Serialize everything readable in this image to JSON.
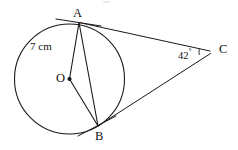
{
  "figure": {
    "type": "circle-tangent-geometry-diagram",
    "background_color": "#ffffff",
    "stroke_color": "#1a1a1a",
    "labels": {
      "center": "O",
      "tangent_point_top": "A",
      "tangent_point_bottom": "B",
      "external_vertex": "C",
      "radius_measure": "7 cm",
      "angle_value": "42",
      "angle_degree_symbol": "°"
    },
    "geometry": {
      "circle": {
        "cx": 69.5,
        "cy": 79.0,
        "r": 55.0,
        "stroke_width": 1.1
      },
      "points": {
        "O": {
          "x": 69.5,
          "y": 79.0
        },
        "A": {
          "x": 79.0,
          "y": 22.5
        },
        "B": {
          "x": 98.0,
          "y": 126.0
        },
        "C": {
          "x": 212.0,
          "y": 52.0
        }
      },
      "segments": [
        {
          "name": "radius-OA",
          "x1": 69.5,
          "y1": 79.0,
          "x2": 79.0,
          "y2": 22.5,
          "width": 1.1
        },
        {
          "name": "radius-OB",
          "x1": 69.5,
          "y1": 79.0,
          "x2": 98.0,
          "y2": 126.0,
          "width": 1.1
        },
        {
          "name": "chord-AB",
          "x1": 79.0,
          "y1": 22.5,
          "x2": 98.0,
          "y2": 126.0,
          "width": 1.1
        },
        {
          "name": "tangent-AC",
          "x1": 79.0,
          "y1": 22.5,
          "x2": 210.0,
          "y2": 51.0,
          "width": 1.0
        },
        {
          "name": "tangent-BC",
          "x1": 98.0,
          "y1": 126.0,
          "x2": 210.5,
          "y2": 53.5,
          "width": 1.0
        },
        {
          "name": "tangent-extension-at-A",
          "x1": 56.0,
          "y1": 19.0,
          "x2": 101.0,
          "y2": 26.0,
          "width": 1.0
        },
        {
          "name": "tangent-extension-at-B",
          "x1": 78.0,
          "y1": 136.0,
          "x2": 116.0,
          "y2": 116.0,
          "width": 1.0
        }
      ],
      "center_dot": {
        "cx": 69.5,
        "cy": 79.0,
        "r": 2.1
      },
      "angle_arc": {
        "cx": 212.0,
        "cy": 52.0,
        "r": 13.0,
        "start_deg": 167,
        "end_deg": 193
      }
    },
    "label_positions": {
      "A": {
        "left": 73,
        "top": 7
      },
      "B": {
        "left": 95,
        "top": 130
      },
      "C": {
        "left": 219,
        "top": 43
      },
      "O": {
        "left": 56,
        "top": 72
      },
      "radius_measure": {
        "left": 30,
        "top": 41
      },
      "angle": {
        "left": 178,
        "top": 48
      }
    }
  }
}
